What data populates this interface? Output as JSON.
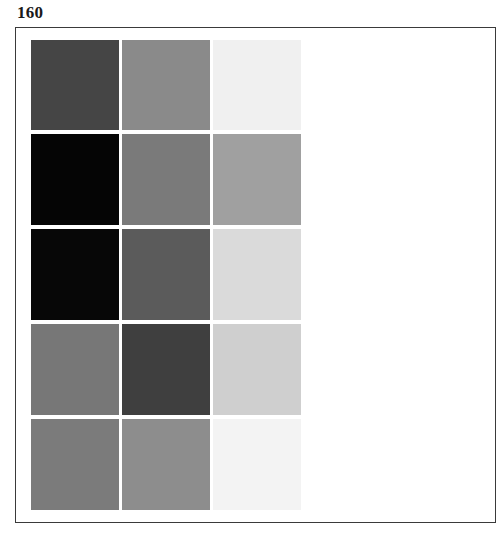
{
  "page": {
    "number": "160"
  },
  "swatch_grid": {
    "rows": 5,
    "columns": 3,
    "cells": [
      [
        {
          "color": "#454545"
        },
        {
          "color": "#8a8a8a"
        },
        {
          "color": "#f0f0f0"
        }
      ],
      [
        {
          "color": "#050505"
        },
        {
          "color": "#7a7a7a"
        },
        {
          "color": "#a0a0a0"
        }
      ],
      [
        {
          "color": "#070707"
        },
        {
          "color": "#5b5b5b"
        },
        {
          "color": "#dadada"
        }
      ],
      [
        {
          "color": "#777777"
        },
        {
          "color": "#3f3f3f"
        },
        {
          "color": "#cfcfcf"
        }
      ],
      [
        {
          "color": "#7b7b7b"
        },
        {
          "color": "#8d8d8d"
        },
        {
          "color": "#f3f3f3"
        }
      ]
    ]
  }
}
